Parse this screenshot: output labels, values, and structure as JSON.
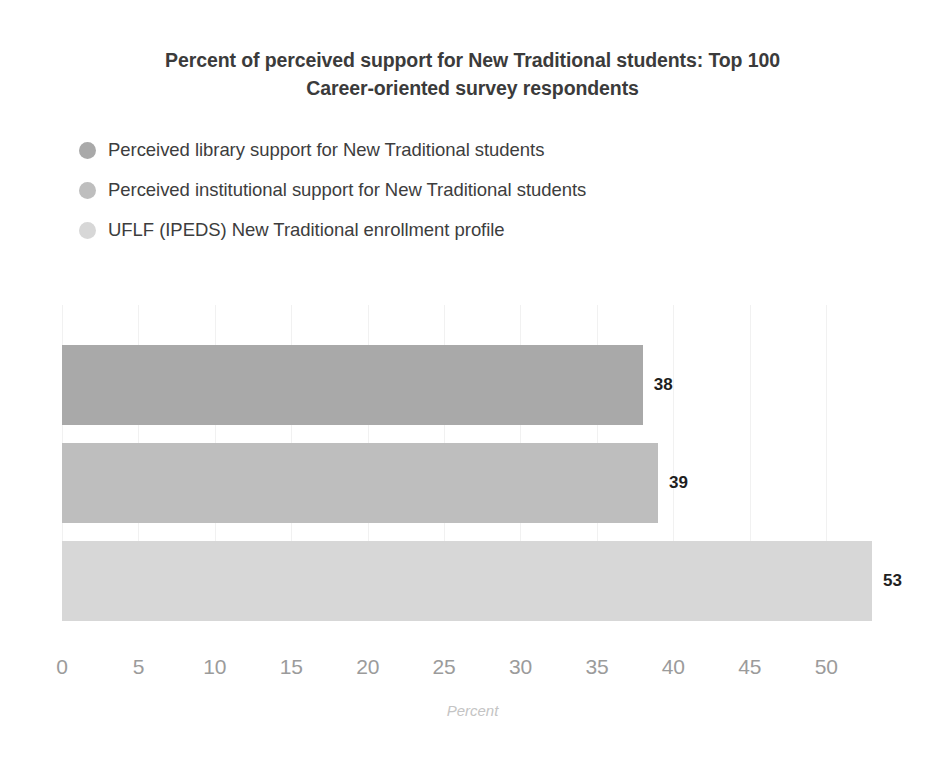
{
  "chart_data": {
    "type": "bar",
    "orientation": "horizontal",
    "title": "Percent of perceived support for New Traditional students: Top 100 Career-oriented survey respondents",
    "title_lines": [
      "Percent of perceived support for New Traditional students: Top 100",
      "Career-oriented survey respondents"
    ],
    "categories": [
      "Perceived library support for New Traditional students",
      "Perceived institutional support for New Traditional students",
      "UFLF (IPEDS) New Traditional enrollment profile"
    ],
    "values": [
      38,
      39,
      53
    ],
    "value_labels": [
      "38",
      "39",
      "53"
    ],
    "xlabel": "Percent",
    "ylabel": "",
    "xlim": [
      0,
      53
    ],
    "axis_max": 53,
    "xticks": [
      0,
      5,
      10,
      15,
      20,
      25,
      30,
      35,
      40,
      45,
      50
    ],
    "xtick_labels": [
      "0",
      "5",
      "10",
      "15",
      "20",
      "25",
      "30",
      "35",
      "40",
      "45",
      "50"
    ],
    "grid": true,
    "grid_axis": "x",
    "legend_position": "top-left",
    "colors": [
      "#a9a9a9",
      "#bebebe",
      "#d7d7d7"
    ],
    "grid_color": "#f1f1f1",
    "title_color": "#3b3b3b",
    "tick_color": "#9b9b9b",
    "axis_label_color": "#c4c4c4",
    "value_label_color": "#1f1f1f"
  },
  "legend": {
    "items": [
      {
        "label": "Perceived library support for New Traditional students",
        "color": "#a9a9a9"
      },
      {
        "label": "Perceived institutional support for New Traditional students",
        "color": "#bebebe"
      },
      {
        "label": "UFLF (IPEDS) New Traditional enrollment profile",
        "color": "#d7d7d7"
      }
    ]
  }
}
